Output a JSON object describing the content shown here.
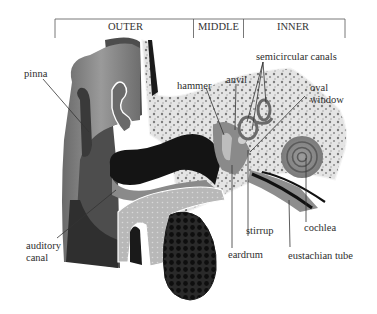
{
  "sections": [
    {
      "label": "OUTER"
    },
    {
      "label": "MIDDLE"
    },
    {
      "label": "INNER"
    }
  ],
  "labels": {
    "pinna": "pinna",
    "auditory_canal_1": "auditory",
    "auditory_canal_2": "canal",
    "hammer": "hammer",
    "anvil": "anvil",
    "semicircular_canals": "semicircular canals",
    "oval_window_1": "oval",
    "oval_window_2": "window",
    "cochlea": "cochlea",
    "stirrup": "stirrup",
    "eardrum": "eardrum",
    "eustachian_tube": "eustachian tube"
  },
  "colors": {
    "bone_fill": "#e2e2e2",
    "skin_dark": "#5a5a5a",
    "skin_mid": "#8c8c8c",
    "canal_black": "#151515",
    "tissue_light": "#c8c8c8",
    "leader_line": "#333333"
  }
}
